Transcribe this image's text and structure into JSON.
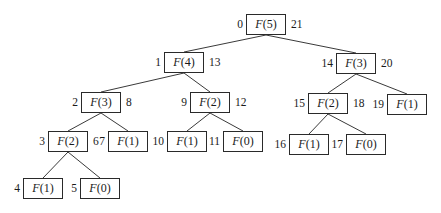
{
  "diagram": {
    "type": "recursion-tree",
    "function": "F",
    "nodes": [
      {
        "id": "n0",
        "label": "F(5)",
        "arg": "5",
        "pre": "0",
        "post": "21",
        "x": 246,
        "y": 14,
        "parent": null
      },
      {
        "id": "n1",
        "label": "F(4)",
        "arg": "4",
        "pre": "1",
        "post": "13",
        "x": 164,
        "y": 52,
        "parent": "n0"
      },
      {
        "id": "n2",
        "label": "F(3)",
        "arg": "3",
        "pre": "2",
        "post": "8",
        "x": 81,
        "y": 92,
        "parent": "n1"
      },
      {
        "id": "n3",
        "label": "F(2)",
        "arg": "2",
        "pre": "3",
        "post": "6",
        "x": 48,
        "y": 131,
        "parent": "n2"
      },
      {
        "id": "n4",
        "label": "F(1)",
        "arg": "1",
        "pre": "4",
        "post": "",
        "x": 23,
        "y": 178,
        "parent": "n3"
      },
      {
        "id": "n5",
        "label": "F(0)",
        "arg": "0",
        "pre": "5",
        "post": "",
        "x": 80,
        "y": 178,
        "parent": "n3"
      },
      {
        "id": "n7",
        "label": "F(1)",
        "arg": "1",
        "pre": "7",
        "post": "",
        "x": 108,
        "y": 131,
        "parent": "n2"
      },
      {
        "id": "n9",
        "label": "F(2)",
        "arg": "2",
        "pre": "9",
        "post": "12",
        "x": 190,
        "y": 92,
        "parent": "n1"
      },
      {
        "id": "n10",
        "label": "F(1)",
        "arg": "1",
        "pre": "10",
        "post": "",
        "x": 167,
        "y": 131,
        "parent": "n9"
      },
      {
        "id": "n11",
        "label": "F(0)",
        "arg": "0",
        "pre": "11",
        "post": "",
        "x": 223,
        "y": 131,
        "parent": "n9"
      },
      {
        "id": "n14",
        "label": "F(3)",
        "arg": "3",
        "pre": "14",
        "post": "20",
        "x": 336,
        "y": 53,
        "parent": "n0"
      },
      {
        "id": "n15",
        "label": "F(2)",
        "arg": "2",
        "pre": "15",
        "post": "18",
        "x": 308,
        "y": 93,
        "parent": "n14"
      },
      {
        "id": "n16",
        "label": "F(1)",
        "arg": "1",
        "pre": "16",
        "post": "",
        "x": 289,
        "y": 134,
        "parent": "n15"
      },
      {
        "id": "n17",
        "label": "F(0)",
        "arg": "0",
        "pre": "17",
        "post": "",
        "x": 346,
        "y": 134,
        "parent": "n15"
      },
      {
        "id": "n19",
        "label": "F(1)",
        "arg": "1",
        "pre": "19",
        "post": "",
        "x": 387,
        "y": 94,
        "parent": "n14"
      }
    ],
    "colors": {
      "line": "#3a3a3a",
      "box_border": "#2a2a2a",
      "text": "#1a1a1a",
      "background": "#ffffff"
    }
  }
}
